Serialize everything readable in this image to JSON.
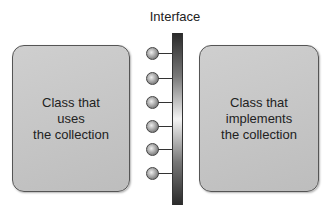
{
  "diagram": {
    "interface_label": "Interface",
    "left_box": {
      "lines": [
        "Class that",
        "uses",
        "the collection"
      ]
    },
    "right_box": {
      "lines": [
        "Class that",
        "implements",
        "the collection"
      ]
    },
    "connector_count": 6,
    "colors": {
      "box_fill": "#c6c6c6",
      "box_border": "#555555",
      "bar_dark": "#2a2a2a",
      "bar_light": "#f4f4f4"
    }
  }
}
